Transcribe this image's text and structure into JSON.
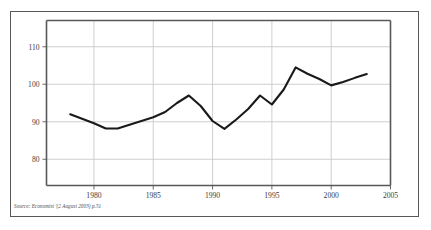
{
  "figure": {
    "source_note": "Source: Economist '(2 August 2003) p.51"
  },
  "chart_data": {
    "type": "line",
    "title": "",
    "subtitle": "",
    "xlabel": "",
    "ylabel": "",
    "xlim": [
      1976,
      2005
    ],
    "ylim": [
      73,
      117
    ],
    "grid": true,
    "legend_position": "none",
    "x_ticks": [
      1980,
      1985,
      1990,
      1995,
      2000,
      2005
    ],
    "x_tick_labels": [
      "1980",
      "1985",
      "1990",
      "1995",
      "2000",
      "2005"
    ],
    "y_ticks": [
      80,
      90,
      100,
      110
    ],
    "y_tick_labels": [
      "80",
      "90",
      "100",
      "110"
    ],
    "line_color": "#1a1a1a",
    "grid_color": "#c9c9cb",
    "axis_color": "#58585a",
    "x": [
      1978,
      1979,
      1980,
      1981,
      1982,
      1983,
      1984,
      1985,
      1986,
      1987,
      1988,
      1989,
      1990,
      1991,
      1992,
      1993,
      1994,
      1995,
      1996,
      1997,
      1998,
      1999,
      2000,
      2001,
      2002,
      2003
    ],
    "values": [
      92.0,
      90.8,
      89.6,
      88.2,
      88.2,
      89.2,
      90.2,
      91.2,
      92.6,
      95.0,
      97.0,
      94.2,
      90.2,
      88.1,
      90.6,
      93.4,
      97.0,
      94.6,
      98.6,
      104.5,
      102.8,
      101.4,
      99.7,
      100.6,
      101.7,
      102.7
    ],
    "series": [
      {
        "name": "index",
        "values": [
          92.0,
          90.8,
          89.6,
          88.2,
          88.2,
          89.2,
          90.2,
          91.2,
          92.6,
          95.0,
          97.0,
          94.2,
          90.2,
          88.1,
          90.6,
          93.4,
          97.0,
          94.6,
          98.6,
          104.5,
          102.8,
          101.4,
          99.7,
          100.6,
          101.7,
          102.7
        ]
      }
    ]
  }
}
